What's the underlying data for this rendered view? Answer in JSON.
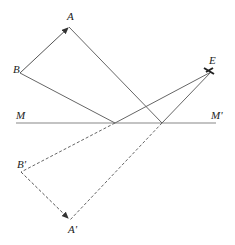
{
  "diagram": {
    "type": "plane-mirror-reflection",
    "labels": {
      "A": "A",
      "B": "B",
      "E": "E",
      "M": "M",
      "M_prime": "M'",
      "B_prime": "B'",
      "A_prime": "A'"
    },
    "colors": {
      "line": "#666666",
      "mirror": "#888888",
      "text": "#222222"
    }
  }
}
